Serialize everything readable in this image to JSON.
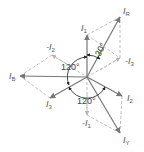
{
  "diagram": {
    "type": "phasor-diagram",
    "center": [
      87,
      77
    ],
    "colors": {
      "solid": "#777777",
      "dashed": "#b5b5b5",
      "text": "#555555",
      "arc": "#333333"
    },
    "phasors_solid": [
      {
        "id": "IR",
        "label": "I",
        "sub": "R",
        "tip": [
          120,
          17
        ],
        "label_pos": [
          123,
          14
        ]
      },
      {
        "id": "I1",
        "label": "I",
        "sub": "1",
        "tip": [
          87,
          35
        ],
        "label_pos": [
          81,
          31
        ]
      },
      {
        "id": "IB",
        "label": "I",
        "sub": "B",
        "tip": [
          20,
          76
        ],
        "label_pos": [
          9,
          79
        ]
      },
      {
        "id": "I3",
        "label": "I",
        "sub": "3",
        "tip": [
          50,
          98
        ],
        "label_pos": [
          46,
          107
        ]
      },
      {
        "id": "I2",
        "label": "I",
        "sub": "2",
        "tip": [
          122,
          96
        ],
        "label_pos": [
          127,
          101
        ]
      },
      {
        "id": "IY",
        "label": "I",
        "sub": "Y",
        "tip": [
          120,
          133
        ],
        "label_pos": [
          123,
          143
        ]
      }
    ],
    "phasors_dashed": [
      {
        "id": "negI3",
        "label": "-I",
        "sub": "3",
        "tip": [
          120,
          58
        ],
        "label_pos": [
          125,
          64
        ]
      },
      {
        "id": "negI2",
        "label": "-I",
        "sub": "2",
        "tip": [
          52,
          55
        ],
        "label_pos": [
          46,
          50
        ]
      },
      {
        "id": "negI1",
        "label": "-I",
        "sub": "1",
        "tip": [
          87,
          115
        ],
        "label_pos": [
          82,
          126
        ]
      }
    ],
    "angles": [
      {
        "text": "30°",
        "pos": [
          103,
          54
        ],
        "rotate": -62
      },
      {
        "text": "120°",
        "pos": [
          58,
          69
        ],
        "rotate": 0
      },
      {
        "text": "120°",
        "pos": [
          76,
          105
        ],
        "rotate": 0
      }
    ]
  }
}
